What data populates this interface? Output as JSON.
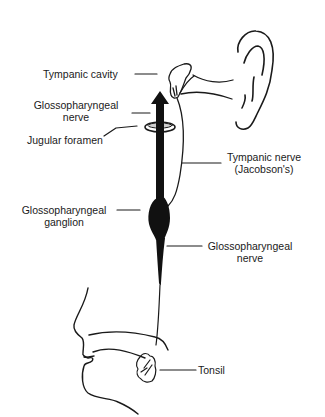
{
  "diagram": {
    "labels": {
      "tympanic_cavity": "Tympanic cavity",
      "glossopharyngeal_nerve_top_1": "Glossopharyngeal",
      "glossopharyngeal_nerve_top_2": "nerve",
      "jugular_foramen": "Jugular foramen",
      "tympanic_nerve_1": "Tympanic nerve",
      "tympanic_nerve_2": "(Jacobson's)",
      "ganglion_1": "Glossopharyngeal",
      "ganglion_2": "ganglion",
      "glossopharyngeal_nerve_bottom_1": "Glossopharyngeal",
      "glossopharyngeal_nerve_bottom_2": "nerve",
      "tonsil": "Tonsil"
    },
    "colors": {
      "ink": "#1a1a1a",
      "background": "#ffffff"
    }
  }
}
